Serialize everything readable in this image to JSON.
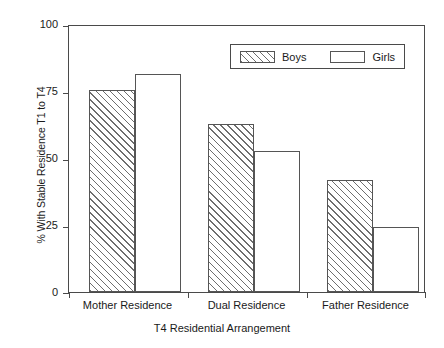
{
  "chart_data": {
    "type": "bar",
    "title": "",
    "subtitle": "",
    "xlabel": "T4 Residential Arrangement",
    "ylabel": "% With Stable Residence T1 to T4",
    "categories": [
      "Mother Residence",
      "Dual Residence",
      "Father Residence"
    ],
    "series": [
      {
        "name": "Boys",
        "values": [
          76,
          63,
          42
        ],
        "fill": "diagonal-hatch"
      },
      {
        "name": "Girls",
        "values": [
          82,
          53,
          24.5
        ],
        "fill": "white"
      }
    ],
    "ylim": [
      0,
      100
    ],
    "yticks": [
      0,
      25,
      50,
      75,
      100
    ],
    "ytick_labels": [
      "0",
      "25",
      "50",
      "75",
      "100"
    ],
    "grid": false,
    "legend_position": "top-center-right",
    "legend_entries": [
      "Boys",
      "Girls"
    ],
    "frame": true,
    "colors": {
      "axis": "#4a4a4a",
      "bar_outline": "#555555",
      "hatch": "#6e6e6e",
      "background": "#ffffff",
      "text": "#1a1a1a"
    }
  }
}
